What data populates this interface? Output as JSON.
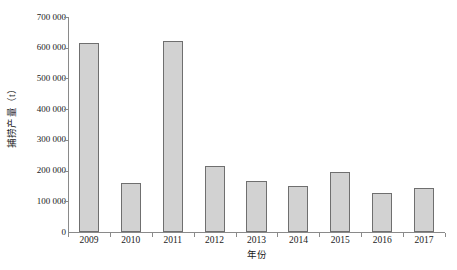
{
  "chart_data": {
    "type": "bar",
    "title": "",
    "subtitle": "",
    "xlabel": "年份",
    "ylabel": "捕捞产量（t）",
    "categories": [
      "2009",
      "2010",
      "2011",
      "2012",
      "2013",
      "2014",
      "2015",
      "2016",
      "2017"
    ],
    "values": [
      615000,
      160000,
      622000,
      215000,
      167000,
      150000,
      196000,
      126000,
      144000
    ],
    "ylim": [
      0,
      700000
    ],
    "yticks": [
      0,
      100000,
      200000,
      300000,
      400000,
      500000,
      600000,
      700000
    ],
    "ytick_labels": [
      "0",
      "100 000",
      "200 000",
      "300 000",
      "400 000",
      "500 000",
      "600 000",
      "700 000"
    ],
    "grid": false,
    "legend": false,
    "legend_position": "none",
    "bar_fill_color": "#d2d2d2",
    "bar_edge_color": "#6f6f6f",
    "axis_color": "#8a8a8a",
    "text_color": "#1a1a1a",
    "background_color": "#ffffff"
  }
}
